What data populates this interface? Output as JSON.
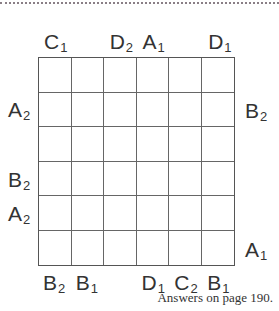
{
  "puzzle": {
    "grid": {
      "rows": 6,
      "cols": 6
    },
    "clues": {
      "top": [
        {
          "col": 0,
          "letter": "C",
          "sub": "1"
        },
        {
          "col": 2,
          "letter": "D",
          "sub": "2"
        },
        {
          "col": 3,
          "letter": "A",
          "sub": "1"
        },
        {
          "col": 5,
          "letter": "D",
          "sub": "1"
        }
      ],
      "bottom": [
        {
          "col": 0,
          "letter": "B",
          "sub": "2"
        },
        {
          "col": 1,
          "letter": "B",
          "sub": "1"
        },
        {
          "col": 3,
          "letter": "D",
          "sub": "1"
        },
        {
          "col": 4,
          "letter": "C",
          "sub": "2"
        },
        {
          "col": 5,
          "letter": "B",
          "sub": "1"
        }
      ],
      "left": [
        {
          "row": 1,
          "letter": "A",
          "sub": "2"
        },
        {
          "row": 3,
          "letter": "B",
          "sub": "2"
        },
        {
          "row": 4,
          "letter": "A",
          "sub": "2"
        }
      ],
      "right": [
        {
          "row": 1,
          "letter": "B",
          "sub": "2"
        },
        {
          "row": 5,
          "letter": "A",
          "sub": "1"
        }
      ]
    },
    "footer": "Answers on page 190."
  }
}
